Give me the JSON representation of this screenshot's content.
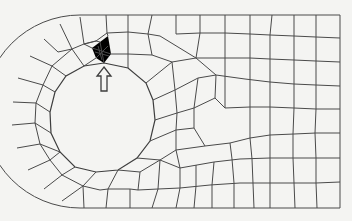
{
  "figure": {
    "colors": {
      "background": "#f4f4f2",
      "mesh_line": "#4a4a4a",
      "arrow_stroke": "#3c3c3c"
    },
    "geometry": {
      "outer_boundary": {
        "left_arc_center": [
          80,
          111
        ],
        "left_arc_radius": 96,
        "top_y": 15,
        "bottom_y": 208,
        "right_x": 340
      },
      "hole": {
        "center": [
          106,
          118
        ],
        "radius": 56
      },
      "refined_region_center": [
        101,
        53
      ],
      "arrow": {
        "tip": [
          104,
          66
        ],
        "tail": [
          104,
          92
        ],
        "direction": "up"
      }
    },
    "annotations": {
      "arrow_label": "refined-mesh-indicator"
    }
  }
}
